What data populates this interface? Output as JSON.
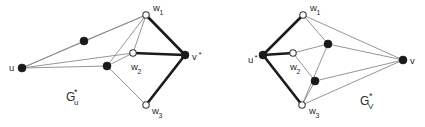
{
  "figure": {
    "background": "#ffffff",
    "width": 425,
    "height": 127,
    "colors": {
      "thin_edge": "#8a8a8a",
      "bold_edge": "#1a1a1a",
      "filled_node": "#1a1a1a",
      "hollow_node_fill": "#ffffff",
      "hollow_node_stroke": "#3a3a3a",
      "text": "#2b2b2b"
    }
  },
  "left_graph": {
    "caption_main": "G",
    "caption_sub": "u",
    "caption_star": "*",
    "caption_full": "G_u*",
    "nodes": [
      {
        "id": "u",
        "label": "u",
        "star": "*",
        "show_star": false,
        "type": "filled",
        "x": 22,
        "y": 68,
        "r": 4.0,
        "label_x": 9,
        "label_y": 71
      },
      {
        "id": "a1",
        "label": "",
        "star": "",
        "show_star": false,
        "type": "filled",
        "x": 84,
        "y": 41,
        "r": 4.0,
        "label_x": 0,
        "label_y": 0
      },
      {
        "id": "a2",
        "label": "",
        "star": "",
        "show_star": false,
        "type": "filled",
        "x": 107,
        "y": 66,
        "r": 4.0,
        "label_x": 0,
        "label_y": 0
      },
      {
        "id": "w1",
        "label": "w",
        "sub": "1",
        "show_star": false,
        "type": "hollow",
        "x": 146,
        "y": 15,
        "r": 3.2,
        "label_x": 153,
        "label_y": 11
      },
      {
        "id": "w2",
        "label": "w",
        "sub": "2",
        "show_star": false,
        "type": "hollow",
        "x": 133,
        "y": 53,
        "r": 3.2,
        "label_x": 131,
        "label_y": 70
      },
      {
        "id": "w3",
        "label": "w",
        "sub": "3",
        "show_star": false,
        "type": "hollow",
        "x": 146,
        "y": 105,
        "r": 3.2,
        "label_x": 152,
        "label_y": 114
      },
      {
        "id": "v",
        "label": "v",
        "star": "*",
        "show_star": true,
        "type": "filled",
        "x": 185,
        "y": 55,
        "r": 4.0,
        "label_x": 192,
        "label_y": 60
      }
    ],
    "edges_thin": [
      {
        "from": "u",
        "to": "w1"
      },
      {
        "from": "u",
        "to": "a1"
      },
      {
        "from": "a1",
        "to": "w1"
      },
      {
        "from": "u",
        "to": "w2"
      },
      {
        "from": "u",
        "to": "a2"
      },
      {
        "from": "a2",
        "to": "w1"
      },
      {
        "from": "a2",
        "to": "w2"
      },
      {
        "from": "a2",
        "to": "w3"
      },
      {
        "from": "w1",
        "to": "w2"
      }
    ],
    "edges_bold": [
      {
        "from": "w1",
        "to": "v"
      },
      {
        "from": "w2",
        "to": "v"
      },
      {
        "from": "w3",
        "to": "v"
      }
    ]
  },
  "right_graph": {
    "caption_main": "G",
    "caption_sub": "V",
    "caption_star": "*",
    "caption_full": "G_V*",
    "nodes": [
      {
        "id": "u",
        "label": "u",
        "star": "*",
        "show_star": true,
        "type": "filled",
        "x": 263,
        "y": 55,
        "r": 4.0,
        "label_x": 248,
        "label_y": 63
      },
      {
        "id": "w1",
        "label": "w",
        "sub": "1",
        "show_star": false,
        "type": "hollow",
        "x": 303,
        "y": 15,
        "r": 3.2,
        "label_x": 310,
        "label_y": 11
      },
      {
        "id": "w2",
        "label": "w",
        "sub": "2",
        "show_star": false,
        "type": "hollow",
        "x": 293,
        "y": 53,
        "r": 3.2,
        "label_x": 290,
        "label_y": 70
      },
      {
        "id": "w3",
        "label": "w",
        "sub": "3",
        "show_star": false,
        "type": "hollow",
        "x": 302,
        "y": 105,
        "r": 3.2,
        "label_x": 309,
        "label_y": 114
      },
      {
        "id": "b1",
        "label": "",
        "star": "",
        "show_star": false,
        "type": "filled",
        "x": 328,
        "y": 44,
        "r": 4.0,
        "label_x": 0,
        "label_y": 0
      },
      {
        "id": "b2",
        "label": "",
        "star": "",
        "show_star": false,
        "type": "filled",
        "x": 315,
        "y": 81,
        "r": 4.0,
        "label_x": 0,
        "label_y": 0
      },
      {
        "id": "v",
        "label": "v",
        "star": "",
        "show_star": false,
        "type": "filled",
        "x": 403,
        "y": 60,
        "r": 4.0,
        "label_x": 410,
        "label_y": 64
      }
    ],
    "edges_thin": [
      {
        "from": "w1",
        "to": "b1"
      },
      {
        "from": "w1",
        "to": "v"
      },
      {
        "from": "b1",
        "to": "v"
      },
      {
        "from": "w2",
        "to": "b1"
      },
      {
        "from": "w2",
        "to": "b2"
      },
      {
        "from": "b2",
        "to": "v"
      },
      {
        "from": "b2",
        "to": "w3"
      },
      {
        "from": "w3",
        "to": "v"
      },
      {
        "from": "w3",
        "to": "b1"
      }
    ],
    "edges_bold": [
      {
        "from": "u",
        "to": "w1"
      },
      {
        "from": "u",
        "to": "w2"
      },
      {
        "from": "u",
        "to": "w3"
      }
    ]
  }
}
